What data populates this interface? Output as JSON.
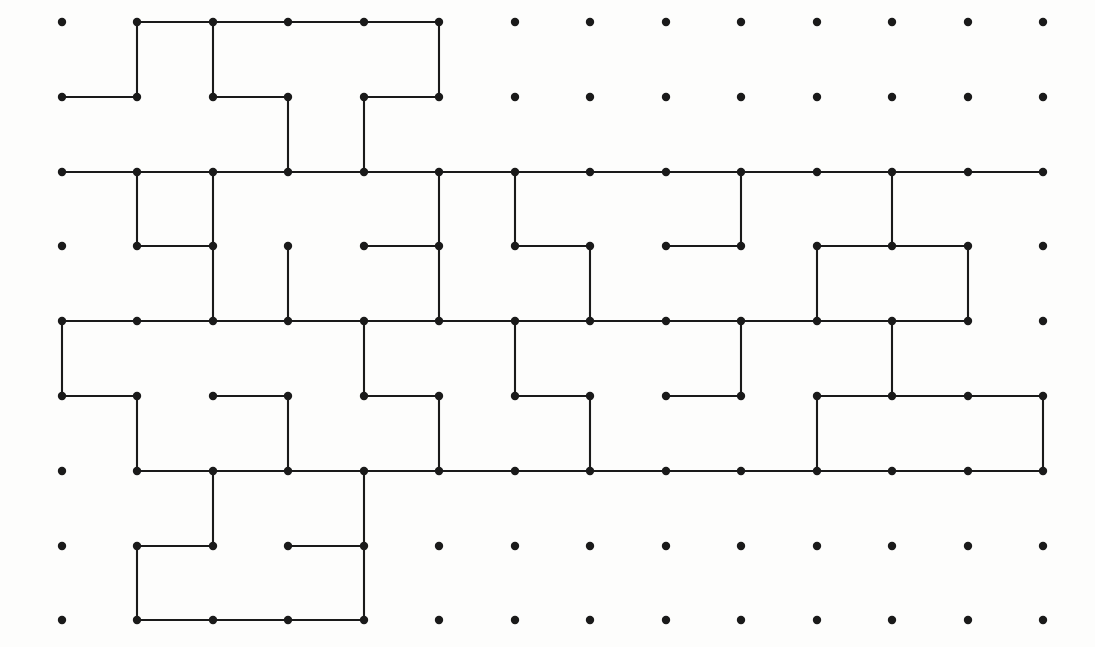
{
  "figure": {
    "title": "",
    "type": "lattice-path-diagram",
    "background_color": "#fdfdfc",
    "dot_color": "#1a1a1a",
    "line_color": "#1a1a1a",
    "dot_radius": 4.2,
    "line_width": 2.1
  },
  "grid": {
    "columns": 14,
    "rows": 9,
    "origin_x": 62,
    "origin_y": 22,
    "step_x": 75.5,
    "step_y": 74.8,
    "col_x": [
      62,
      137,
      213,
      288,
      364,
      439,
      515,
      590,
      666,
      741,
      817,
      892,
      968,
      1043
    ],
    "row_y": [
      22,
      97,
      172,
      246,
      321,
      396,
      471,
      546,
      620
    ]
  },
  "chart_data": {
    "type": "scatter",
    "title": "",
    "xlabel": "",
    "ylabel": "",
    "points_cols": 14,
    "points_rows": 9,
    "edges_h": [
      [
        1,
        0,
        5
      ],
      [
        0,
        1,
        1
      ],
      [
        2,
        1,
        3
      ],
      [
        4,
        1,
        5
      ],
      [
        0,
        2,
        13
      ],
      [
        1,
        3,
        2
      ],
      [
        4,
        3,
        5
      ],
      [
        6,
        3,
        7
      ],
      [
        8,
        3,
        9
      ],
      [
        10,
        3,
        11
      ],
      [
        11,
        3,
        12
      ],
      [
        0,
        4,
        12
      ],
      [
        0,
        5,
        1
      ],
      [
        2,
        5,
        3
      ],
      [
        4,
        5,
        5
      ],
      [
        6,
        5,
        7
      ],
      [
        8,
        5,
        9
      ],
      [
        10,
        5,
        11
      ],
      [
        11,
        5,
        12
      ],
      [
        12,
        5,
        13
      ],
      [
        1,
        6,
        13
      ],
      [
        1,
        7,
        2
      ],
      [
        3,
        7,
        4
      ],
      [
        1,
        8,
        4
      ]
    ],
    "edges_v": [
      [
        1,
        0,
        1
      ],
      [
        2,
        0,
        1
      ],
      [
        5,
        0,
        1
      ],
      [
        3,
        1,
        2
      ],
      [
        4,
        1,
        2
      ],
      [
        1,
        2,
        3
      ],
      [
        6,
        2,
        3
      ],
      [
        9,
        2,
        3
      ],
      [
        11,
        2,
        3
      ],
      [
        2,
        2,
        4
      ],
      [
        5,
        2,
        4
      ],
      [
        3,
        3,
        4
      ],
      [
        7,
        3,
        4
      ],
      [
        10,
        3,
        4
      ],
      [
        12,
        3,
        4
      ],
      [
        0,
        4,
        5
      ],
      [
        4,
        4,
        5
      ],
      [
        6,
        4,
        5
      ],
      [
        9,
        4,
        5
      ],
      [
        11,
        4,
        5
      ],
      [
        1,
        5,
        6
      ],
      [
        3,
        5,
        6
      ],
      [
        5,
        5,
        6
      ],
      [
        7,
        5,
        6
      ],
      [
        10,
        5,
        6
      ],
      [
        13,
        5,
        6
      ],
      [
        2,
        6,
        7
      ],
      [
        4,
        6,
        7
      ],
      [
        1,
        7,
        8
      ],
      [
        4,
        7,
        8
      ]
    ]
  },
  "legend": {
    "visible": false,
    "entries": []
  },
  "annotations": []
}
